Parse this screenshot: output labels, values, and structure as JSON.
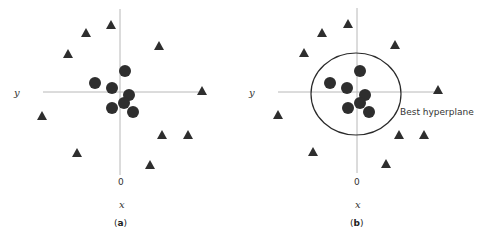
{
  "chart_data": [
    {
      "type": "scatter",
      "panel": "a",
      "caption_letter": "a",
      "xlabel": "x",
      "ylabel": "y",
      "origin_label": "0",
      "legend": [],
      "series": [
        {
          "name": "circles",
          "marker": "circle",
          "points": [
            [
              125,
              71
            ],
            [
              95,
              83
            ],
            [
              112,
              88
            ],
            [
              129,
              95
            ],
            [
              124,
              103
            ],
            [
              112,
              108
            ],
            [
              133,
              112
            ]
          ]
        },
        {
          "name": "triangles",
          "marker": "triangle",
          "points": [
            [
              111,
              25
            ],
            [
              86,
              33
            ],
            [
              159,
              46
            ],
            [
              68,
              54
            ],
            [
              202,
              91
            ],
            [
              42,
              116
            ],
            [
              162,
              135
            ],
            [
              188,
              135
            ],
            [
              77,
              153
            ],
            [
              150,
              165
            ]
          ]
        }
      ],
      "axes": {
        "x_line": [
          43,
          203,
          92
        ],
        "y_line": [
          120,
          9,
          175
        ]
      }
    },
    {
      "type": "scatter",
      "panel": "b",
      "caption_letter": "b",
      "xlabel": "x",
      "ylabel": "y",
      "origin_label": "0",
      "annotation": "Best hyperplane",
      "hyperplane": {
        "shape": "circle",
        "cx": 356,
        "cy": 94,
        "rx": 45,
        "ry": 41
      },
      "series": [
        {
          "name": "circles",
          "marker": "circle",
          "points": [
            [
              360,
              71
            ],
            [
              330,
              83
            ],
            [
              347,
              88
            ],
            [
              365,
              95
            ],
            [
              360,
              103
            ],
            [
              348,
              108
            ],
            [
              369,
              112
            ]
          ]
        },
        {
          "name": "triangles",
          "marker": "triangle",
          "points": [
            [
              348,
              24
            ],
            [
              322,
              33
            ],
            [
              395,
              45
            ],
            [
              304,
              53
            ],
            [
              438,
              90
            ],
            [
              278,
              115
            ],
            [
              399,
              135
            ],
            [
              424,
              135
            ],
            [
              313,
              152
            ],
            [
              386,
              164
            ]
          ]
        }
      ],
      "axes": {
        "x_line": [
          278,
          440,
          92
        ],
        "y_line": [
          357,
          8,
          173
        ]
      }
    }
  ],
  "panel_a": {
    "y_label": "y",
    "x_label": "x",
    "origin": "0",
    "caption_open": "(",
    "caption_letter": "a",
    "caption_close": ")"
  },
  "panel_b": {
    "y_label": "y",
    "x_label": "x",
    "origin": "0",
    "caption_open": "(",
    "caption_letter": "b",
    "caption_close": ")",
    "annotation": "Best hyperplane"
  },
  "colors": {
    "marker": "#2e2e2e",
    "axis": "#b8b8b8",
    "hyperplane": "#2a2a2a"
  }
}
